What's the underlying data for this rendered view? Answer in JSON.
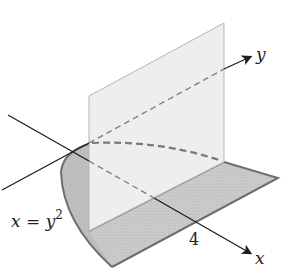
{
  "diagram": {
    "labels": {
      "x_axis": "x",
      "y_axis": "y",
      "curve": "x = y",
      "curve_exp": "2",
      "tick_x": "4"
    },
    "colors": {
      "plane_fill": "#ececec",
      "plane_edge": "#b5b5b5",
      "base_fill": "#c9c9c9",
      "base_edge": "#6e6e6e",
      "axis": "#1e1e1e",
      "dashed": "#7a7a7a"
    }
  }
}
